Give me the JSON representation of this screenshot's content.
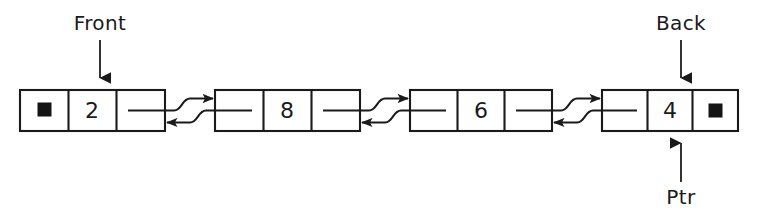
{
  "diagram": {
    "type": "doubly-linked-list",
    "title": "",
    "background_color": "#ffffff",
    "stroke_color": "#1a1a1a",
    "null_marker_color": "#141414",
    "nodes": [
      {
        "id": "node-1",
        "value": "2",
        "prev_cell": "null-marker",
        "next_cell": "pointer-stub",
        "x": 20,
        "width": 145
      },
      {
        "id": "node-2",
        "value": "8",
        "prev_cell": "pointer-stub",
        "next_cell": "pointer-stub",
        "x": 215,
        "width": 145
      },
      {
        "id": "node-3",
        "value": "6",
        "prev_cell": "pointer-stub",
        "next_cell": "pointer-stub",
        "x": 410,
        "width": 142
      },
      {
        "id": "node-4",
        "value": "4",
        "prev_cell": "pointer-stub",
        "next_cell": "null-marker",
        "x": 602,
        "width": 136
      }
    ],
    "node_geometry": {
      "top": 90,
      "bottom": 131,
      "height": 41
    },
    "links": [
      {
        "id": "link-1-2",
        "from": "node-1",
        "to": "node-2",
        "direction": "bidirectional"
      },
      {
        "id": "link-2-3",
        "from": "node-2",
        "to": "node-3",
        "direction": "bidirectional"
      },
      {
        "id": "link-3-4",
        "from": "node-3",
        "to": "node-4",
        "direction": "bidirectional"
      }
    ],
    "pointer_labels": [
      {
        "id": "front-label",
        "text": "Front",
        "target_node": "node-1",
        "position": "above",
        "arrow_direction": "down",
        "label_x": 100,
        "label_y": 24,
        "line_from_y": 38,
        "line_to_y": 88,
        "arrow_x": 100
      },
      {
        "id": "back-label",
        "text": "Back",
        "target_node": "node-4",
        "position": "above",
        "arrow_direction": "down",
        "label_x": 681,
        "label_y": 24,
        "line_from_y": 38,
        "line_to_y": 88,
        "arrow_x": 681
      },
      {
        "id": "ptr-label",
        "text": "Ptr",
        "target_node": "node-4",
        "position": "below",
        "arrow_direction": "up",
        "label_x": 681,
        "label_y": 198,
        "line_from_y": 184,
        "line_to_y": 133,
        "arrow_x": 681
      }
    ]
  }
}
